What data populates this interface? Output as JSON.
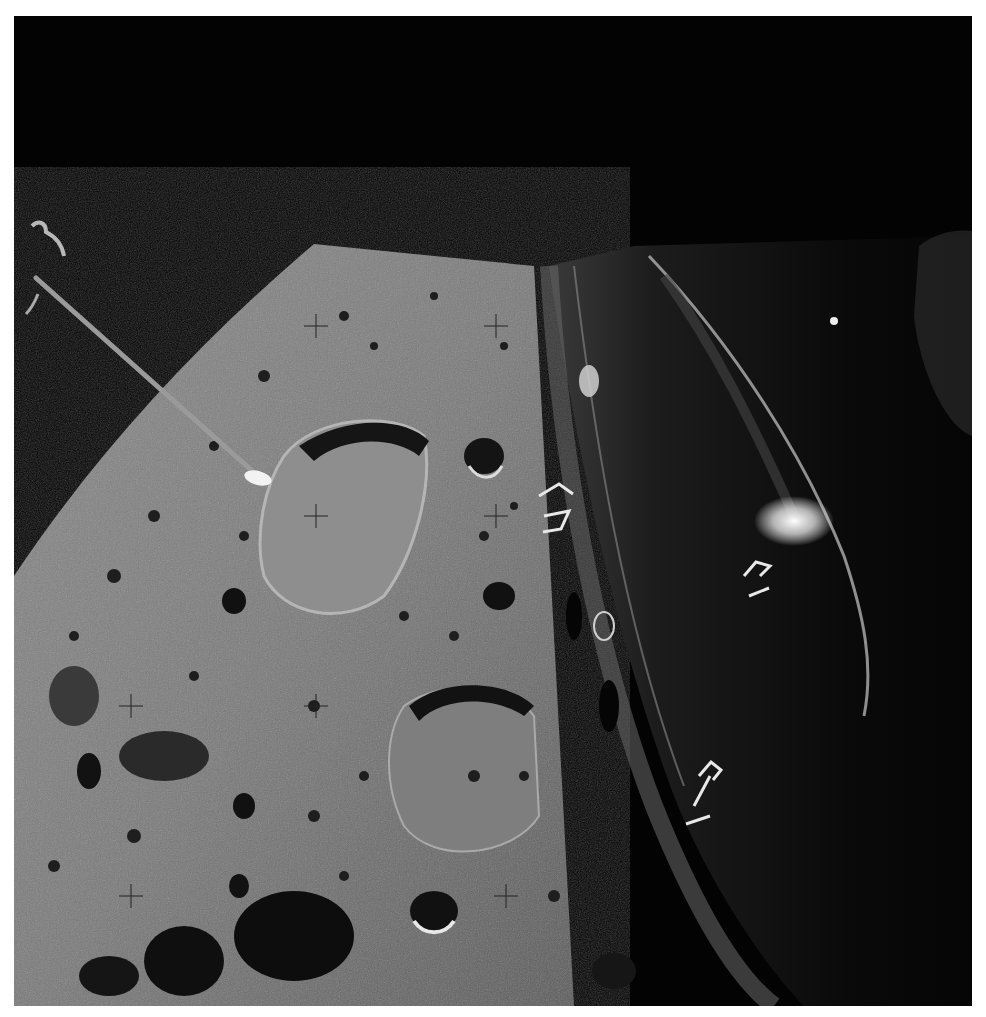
{
  "image": {
    "subject": "Lunar surface photographed from orbit with spacecraft hull in foreground",
    "elements": [
      "black space background",
      "cratered lunar surface",
      "spacecraft hull edge",
      "antenna boom",
      "reseau crosshair marks",
      "large crater with flat floor",
      "reflective hull markings"
    ],
    "colors": {
      "space": "#030303",
      "surface_light": "#9a9a9a",
      "surface_mid": "#6e6e6e",
      "shadow": "#111111",
      "hull": "#1a1a1a",
      "highlight": "#f0f0f0",
      "border": "#ffffff"
    }
  }
}
